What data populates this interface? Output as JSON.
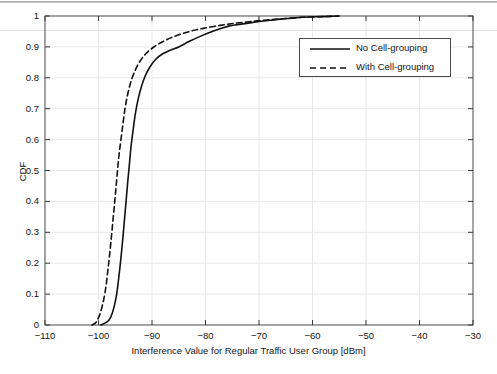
{
  "chart_data": {
    "type": "line",
    "title": "",
    "xlabel": "Interference Value for Regular Traffic User Group [dBm]",
    "ylabel": "CDF",
    "xlim": [
      -110,
      -30
    ],
    "ylim": [
      0,
      1
    ],
    "xticks": [
      -110,
      -100,
      -90,
      -80,
      -70,
      -60,
      -50,
      -40,
      -30
    ],
    "xtick_labels": [
      "−110",
      "−100",
      "−90",
      "−80",
      "−70",
      "−60",
      "−50",
      "−40",
      "−30"
    ],
    "yticks": [
      0,
      0.1,
      0.2,
      0.3,
      0.4,
      0.5,
      0.6,
      0.7,
      0.8,
      0.9,
      1
    ],
    "ytick_labels": [
      "0",
      "0.1",
      "0.2",
      "0.3",
      "0.4",
      "0.5",
      "0.6",
      "0.7",
      "0.8",
      "0.9",
      "1"
    ],
    "grid": true,
    "legend_position": "upper right",
    "series": [
      {
        "name": "No Cell-grouping",
        "style": "solid",
        "color": "#111111",
        "points": [
          [
            -99.6,
            0.0
          ],
          [
            -99.0,
            0.004
          ],
          [
            -98.4,
            0.01
          ],
          [
            -97.9,
            0.02
          ],
          [
            -97.4,
            0.04
          ],
          [
            -97.0,
            0.065
          ],
          [
            -96.6,
            0.1
          ],
          [
            -96.3,
            0.14
          ],
          [
            -96.0,
            0.185
          ],
          [
            -95.7,
            0.235
          ],
          [
            -95.4,
            0.29
          ],
          [
            -95.1,
            0.35
          ],
          [
            -94.8,
            0.41
          ],
          [
            -94.5,
            0.47
          ],
          [
            -94.2,
            0.525
          ],
          [
            -93.9,
            0.58
          ],
          [
            -93.5,
            0.635
          ],
          [
            -93.1,
            0.685
          ],
          [
            -92.6,
            0.73
          ],
          [
            -92.0,
            0.77
          ],
          [
            -91.3,
            0.805
          ],
          [
            -90.4,
            0.835
          ],
          [
            -89.3,
            0.86
          ],
          [
            -88.0,
            0.878
          ],
          [
            -86.5,
            0.89
          ],
          [
            -85.0,
            0.9
          ],
          [
            -83.0,
            0.918
          ],
          [
            -81.0,
            0.934
          ],
          [
            -79.0,
            0.948
          ],
          [
            -77.0,
            0.96
          ],
          [
            -75.5,
            0.968
          ],
          [
            -74.0,
            0.972
          ],
          [
            -72.0,
            0.977
          ],
          [
            -70.0,
            0.982
          ],
          [
            -68.0,
            0.986
          ],
          [
            -66.0,
            0.99
          ],
          [
            -64.0,
            0.993
          ],
          [
            -62.0,
            0.996
          ],
          [
            -60.0,
            0.997
          ],
          [
            -58.0,
            0.998
          ],
          [
            -56.5,
            0.999
          ],
          [
            -55.2,
            1.0
          ]
        ]
      },
      {
        "name": "With Cell-grouping",
        "style": "dashed",
        "color": "#111111",
        "points": [
          [
            -101.2,
            0.0
          ],
          [
            -100.6,
            0.006
          ],
          [
            -100.2,
            0.016
          ],
          [
            -99.8,
            0.032
          ],
          [
            -99.4,
            0.055
          ],
          [
            -99.0,
            0.085
          ],
          [
            -98.6,
            0.125
          ],
          [
            -98.3,
            0.17
          ],
          [
            -98.0,
            0.215
          ],
          [
            -97.7,
            0.265
          ],
          [
            -97.4,
            0.32
          ],
          [
            -97.1,
            0.375
          ],
          [
            -96.8,
            0.43
          ],
          [
            -96.5,
            0.49
          ],
          [
            -96.2,
            0.545
          ],
          [
            -95.8,
            0.6
          ],
          [
            -95.4,
            0.655
          ],
          [
            -95.0,
            0.705
          ],
          [
            -94.5,
            0.75
          ],
          [
            -93.9,
            0.79
          ],
          [
            -93.2,
            0.822
          ],
          [
            -92.3,
            0.852
          ],
          [
            -91.2,
            0.877
          ],
          [
            -89.8,
            0.898
          ],
          [
            -88.2,
            0.915
          ],
          [
            -86.4,
            0.93
          ],
          [
            -84.5,
            0.942
          ],
          [
            -82.5,
            0.952
          ],
          [
            -80.4,
            0.96
          ],
          [
            -78.2,
            0.967
          ],
          [
            -76.0,
            0.973
          ],
          [
            -73.8,
            0.978
          ],
          [
            -71.5,
            0.982
          ],
          [
            -69.2,
            0.986
          ],
          [
            -67.0,
            0.989
          ],
          [
            -64.8,
            0.992
          ],
          [
            -62.5,
            0.995
          ],
          [
            -60.2,
            0.997
          ],
          [
            -58.0,
            0.998
          ],
          [
            -56.2,
            0.999
          ],
          [
            -55.0,
            1.0
          ]
        ]
      }
    ]
  },
  "legend": {
    "items": [
      {
        "label": "No Cell-grouping",
        "style": "solid"
      },
      {
        "label": "With Cell-grouping",
        "style": "dashed"
      }
    ]
  }
}
